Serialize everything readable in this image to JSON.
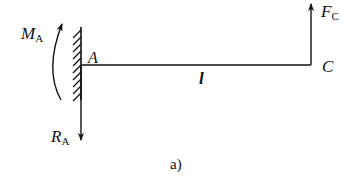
{
  "diagram": {
    "type": "cantilever-beam-free-body",
    "caption": "a)",
    "points": {
      "fixed_end": "A",
      "free_end": "C"
    },
    "length_label": "l",
    "loads": {
      "moment": {
        "symbol": "M",
        "subscript": "A"
      },
      "reaction": {
        "symbol": "R",
        "subscript": "A"
      },
      "force": {
        "symbol": "F",
        "subscript": "C"
      }
    },
    "colors": {
      "line": "#111111",
      "background": "#ffffff"
    }
  }
}
